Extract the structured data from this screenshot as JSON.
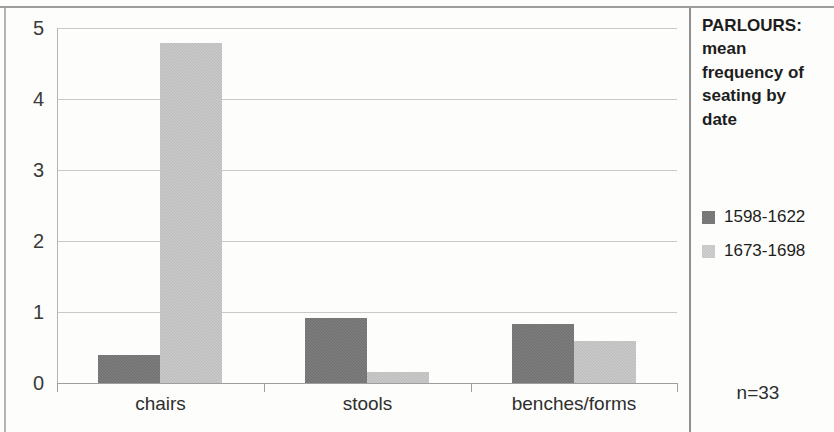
{
  "chart_data": {
    "type": "bar",
    "title": "PARLOURS: mean frequency of seating by date",
    "title_lines": [
      "PARLOURS:",
      "mean",
      "frequency of",
      "seating by",
      "date"
    ],
    "xlabel": "",
    "ylabel": "",
    "ylim": [
      0,
      5
    ],
    "y_ticks": [
      "0",
      "1",
      "2",
      "3",
      "4",
      "5"
    ],
    "grid": true,
    "legend_position": "right",
    "categories": [
      "chairs",
      "stools",
      "benches/forms"
    ],
    "series": [
      {
        "name": "1598-1622",
        "color": "#6e6e6e",
        "values": [
          0.4,
          0.92,
          0.83
        ]
      },
      {
        "name": "1673-1698",
        "color": "#bababa",
        "values": [
          4.79,
          0.15,
          0.59
        ]
      }
    ],
    "annotations": [
      {
        "name": "sample-size",
        "text": "n=33"
      }
    ]
  }
}
